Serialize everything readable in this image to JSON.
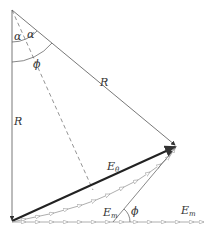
{
  "diagram": {
    "labels": {
      "alpha_left": "α",
      "alpha_right": "α",
      "phi_top": "ϕ",
      "R_right": "R",
      "R_left": "R",
      "E_theta": "E",
      "E_theta_sub": "θ",
      "E_m_lower": "E",
      "E_m_lower_sub": "m",
      "phi_bottom": "ϕ",
      "E_m_right": "E",
      "E_m_right_sub": "m"
    },
    "colors": {
      "line": "#555555",
      "bold": "#222222",
      "chain": "#aaaaaa"
    }
  }
}
